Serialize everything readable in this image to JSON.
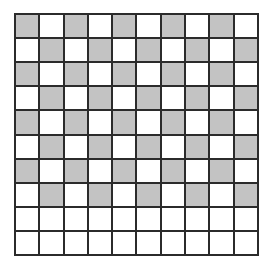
{
  "figure": {
    "title": "",
    "background_color": "#ffffff"
  },
  "grid": {
    "rows": 10,
    "columns": 10,
    "line_color": "#2b2b2b",
    "line_width_px": 2,
    "shaded_color": "#c3c3c3",
    "unshaded_color": "#ffffff",
    "shaded_count": 40,
    "unshaded_count": 60,
    "cells": [
      [
        1,
        0,
        1,
        0,
        1,
        0,
        1,
        0,
        1,
        0
      ],
      [
        0,
        1,
        0,
        1,
        0,
        1,
        0,
        1,
        0,
        1
      ],
      [
        1,
        0,
        1,
        0,
        1,
        0,
        1,
        0,
        1,
        0
      ],
      [
        0,
        1,
        0,
        1,
        0,
        1,
        0,
        1,
        0,
        1
      ],
      [
        1,
        0,
        1,
        0,
        1,
        0,
        1,
        0,
        1,
        0
      ],
      [
        0,
        1,
        0,
        1,
        0,
        1,
        0,
        1,
        0,
        1
      ],
      [
        1,
        0,
        1,
        0,
        1,
        0,
        1,
        0,
        1,
        0
      ],
      [
        0,
        1,
        0,
        1,
        0,
        1,
        0,
        1,
        0,
        1
      ],
      [
        0,
        0,
        0,
        0,
        0,
        0,
        0,
        0,
        0,
        0
      ],
      [
        0,
        0,
        0,
        0,
        0,
        0,
        0,
        0,
        0,
        0
      ]
    ]
  }
}
